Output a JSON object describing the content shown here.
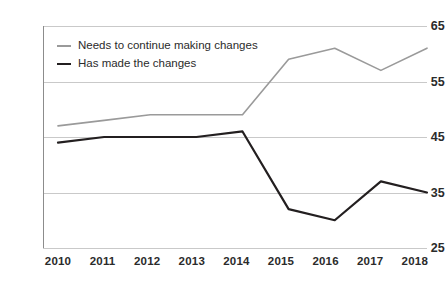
{
  "chart_data": {
    "type": "line",
    "title": "",
    "xlabel": "",
    "ylabel": "",
    "categories": [
      "2010",
      "2011",
      "2012",
      "2013",
      "2014",
      "2015",
      "2016",
      "2017",
      "2018"
    ],
    "x": [
      2010,
      2011,
      2012,
      2013,
      2014,
      2015,
      2016,
      2017,
      2018
    ],
    "ylim": [
      25,
      65
    ],
    "yticks": [
      25,
      35,
      45,
      55,
      65
    ],
    "grid": true,
    "legend_position": "top-left",
    "series": [
      {
        "name": "Needs to continue making changes",
        "color": "#9a9a9a",
        "values": [
          47,
          48,
          49,
          49,
          49,
          59,
          61,
          57,
          61
        ]
      },
      {
        "name": "Has made the changes",
        "color": "#231f20",
        "values": [
          44,
          45,
          45,
          45,
          46,
          32,
          30,
          37,
          35
        ]
      }
    ]
  },
  "axis": {
    "y_tick_labels": [
      "65",
      "55",
      "45",
      "35",
      "25"
    ],
    "x_tick_labels": [
      "2010",
      "2011",
      "2012",
      "2013",
      "2014",
      "2015",
      "2016",
      "2017",
      "2018"
    ]
  },
  "legend": {
    "items": [
      {
        "label": "Needs to continue making changes",
        "color": "#9a9a9a"
      },
      {
        "label": "Has made the changes",
        "color": "#231f20"
      }
    ]
  },
  "colors": {
    "grid": "#c9c9c9",
    "axis": "#8c8c8c",
    "text": "#2b2b2b",
    "background": "#ffffff"
  }
}
